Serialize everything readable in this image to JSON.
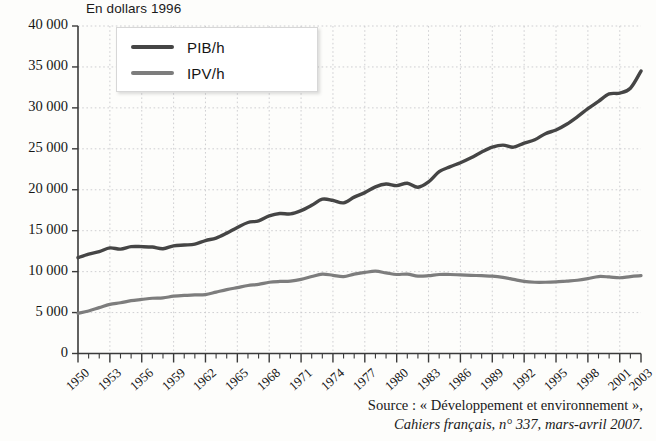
{
  "chart_data": {
    "type": "line",
    "title": "En dollars 1996",
    "xlabel": "",
    "ylabel": "",
    "ylim": [
      0,
      40000
    ],
    "xlim": [
      1950,
      2003
    ],
    "grid": true,
    "legend_position": "top-left-inside",
    "ytick_labels": [
      "40 000",
      "35 000",
      "30 000",
      "25 000",
      "20 000",
      "15 000",
      "10 000",
      "5 000",
      "0"
    ],
    "ytick_values": [
      40000,
      35000,
      30000,
      25000,
      20000,
      15000,
      10000,
      5000,
      0
    ],
    "xtick_labels": [
      "1950",
      "1953",
      "1956",
      "1959",
      "1962",
      "1965",
      "1968",
      "1971",
      "1974",
      "1977",
      "1980",
      "1983",
      "1986",
      "1989",
      "1992",
      "1995",
      "1998",
      "2001",
      "2003"
    ],
    "xtick_values": [
      1950,
      1953,
      1956,
      1959,
      1962,
      1965,
      1968,
      1971,
      1974,
      1977,
      1980,
      1983,
      1986,
      1989,
      1992,
      1995,
      1998,
      2001,
      2003
    ],
    "x": [
      1950,
      1951,
      1952,
      1953,
      1954,
      1955,
      1956,
      1957,
      1958,
      1959,
      1960,
      1961,
      1962,
      1963,
      1964,
      1965,
      1966,
      1967,
      1968,
      1969,
      1970,
      1971,
      1972,
      1973,
      1974,
      1975,
      1976,
      1977,
      1978,
      1979,
      1980,
      1981,
      1982,
      1983,
      1984,
      1985,
      1986,
      1987,
      1988,
      1989,
      1990,
      1991,
      1992,
      1993,
      1994,
      1995,
      1996,
      1997,
      1998,
      1999,
      2000,
      2001,
      2002,
      2003
    ],
    "series": [
      {
        "name": "PIB/h",
        "color": "#454545",
        "values": [
          11700,
          12150,
          12450,
          12900,
          12750,
          13050,
          13050,
          13000,
          12800,
          13150,
          13250,
          13350,
          13800,
          14100,
          14700,
          15400,
          16000,
          16200,
          16800,
          17100,
          17050,
          17450,
          18100,
          18850,
          18700,
          18400,
          19100,
          19650,
          20350,
          20700,
          20500,
          20800,
          20300,
          20950,
          22200,
          22800,
          23300,
          23900,
          24600,
          25200,
          25450,
          25200,
          25700,
          26100,
          26850,
          27300,
          28000,
          28900,
          29900,
          30800,
          31700,
          31800,
          32400,
          34500
        ]
      },
      {
        "name": "IPV/h",
        "color": "#7d7d7d",
        "values": [
          4900,
          5200,
          5600,
          6000,
          6200,
          6450,
          6600,
          6750,
          6800,
          7000,
          7100,
          7150,
          7200,
          7500,
          7800,
          8050,
          8300,
          8450,
          8700,
          8800,
          8850,
          9050,
          9400,
          9700,
          9550,
          9400,
          9700,
          9900,
          10050,
          9850,
          9650,
          9700,
          9450,
          9500,
          9650,
          9650,
          9600,
          9550,
          9500,
          9450,
          9300,
          9050,
          8800,
          8700,
          8700,
          8750,
          8850,
          8950,
          9150,
          9400,
          9350,
          9250,
          9400,
          9500
        ]
      }
    ]
  },
  "legend": {
    "entries": [
      {
        "label": "PIB/h",
        "color": "#454545"
      },
      {
        "label": "IPV/h",
        "color": "#7d7d7d"
      }
    ]
  },
  "source": {
    "line1": "Source : « Développement et environnement »,",
    "line2": "Cahiers français, n° 337, mars-avril 2007."
  }
}
